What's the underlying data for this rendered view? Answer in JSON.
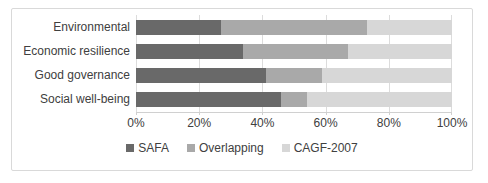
{
  "chart_data": {
    "type": "bar",
    "orientation": "horizontal",
    "stacked": true,
    "title": "",
    "xlabel": "",
    "ylabel": "",
    "categories": [
      "Environmental",
      "Economic resilience",
      "Good governance",
      "Social well-being"
    ],
    "series": [
      {
        "name": "SAFA",
        "color": "#696969",
        "values": [
          27,
          34,
          41,
          46
        ]
      },
      {
        "name": "Overlapping",
        "color": "#a9a9a9",
        "values": [
          46,
          33,
          18,
          8
        ]
      },
      {
        "name": "CAGF-2007",
        "color": "#d7d7d7",
        "values": [
          27,
          33,
          41,
          46
        ]
      }
    ],
    "x_ticks": [
      "0%",
      "20%",
      "40%",
      "60%",
      "80%",
      "100%"
    ],
    "x_tick_positions": [
      0,
      20,
      40,
      60,
      80,
      100
    ],
    "xlim": [
      0,
      100
    ],
    "grid": true,
    "legend_position": "bottom"
  },
  "styles": {
    "background": "#ffffff",
    "frame_border_color": "#d9d9d9",
    "gridline_color": "#dcdcdc",
    "axis_line_color": "#d0d0d0",
    "text_color": "#404040"
  }
}
